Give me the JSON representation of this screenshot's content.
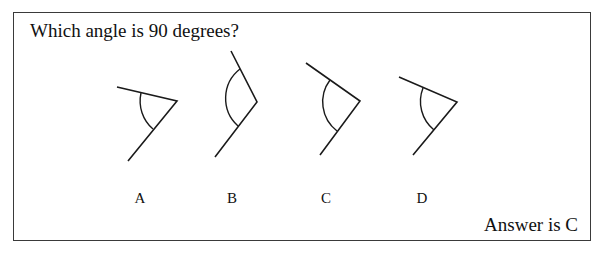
{
  "question": "Which angle is 90 degrees?",
  "answer": "Answer is C",
  "options": [
    {
      "label": "A",
      "vertex": [
        177,
        101
      ],
      "arm1": [
        117,
        87
      ],
      "arm2": [
        128,
        161
      ],
      "arc_start": [
        141,
        93
      ],
      "arc_end": [
        153,
        129
      ],
      "label_x": 140
    },
    {
      "label": "B",
      "vertex": [
        257,
        102
      ],
      "arm1": [
        231,
        51
      ],
      "arm2": [
        215,
        157
      ],
      "arc_start": [
        240,
        69
      ],
      "arc_end": [
        238,
        126
      ],
      "label_x": 232
    },
    {
      "label": "C",
      "vertex": [
        360,
        101
      ],
      "arm1": [
        306,
        63
      ],
      "arm2": [
        320,
        155
      ],
      "arc_start": [
        330,
        80
      ],
      "arc_end": [
        337,
        131
      ],
      "label_x": 326
    },
    {
      "label": "D",
      "vertex": [
        457,
        102
      ],
      "arm1": [
        399,
        77
      ],
      "arm2": [
        413,
        155
      ],
      "arc_start": [
        423,
        88
      ],
      "arc_end": [
        434,
        130
      ],
      "label_x": 422
    }
  ],
  "colors": {
    "stroke": "#1a1a1a",
    "border": "#3a3a3a"
  }
}
